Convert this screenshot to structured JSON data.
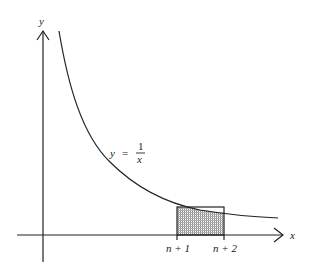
{
  "diagram": {
    "type": "function-plot",
    "function_label": {
      "lhs": "y",
      "eq": "=",
      "numerator": "1",
      "denominator": "x"
    },
    "axes": {
      "x_label": "x",
      "y_label": "y"
    },
    "ticks": {
      "left": "n + 1",
      "right": "n + 2"
    },
    "rectangle": {
      "shaded": true,
      "pattern": "dotted-grid"
    },
    "colors": {
      "line": "#222222",
      "shade": "#888888",
      "background": "#ffffff"
    }
  }
}
